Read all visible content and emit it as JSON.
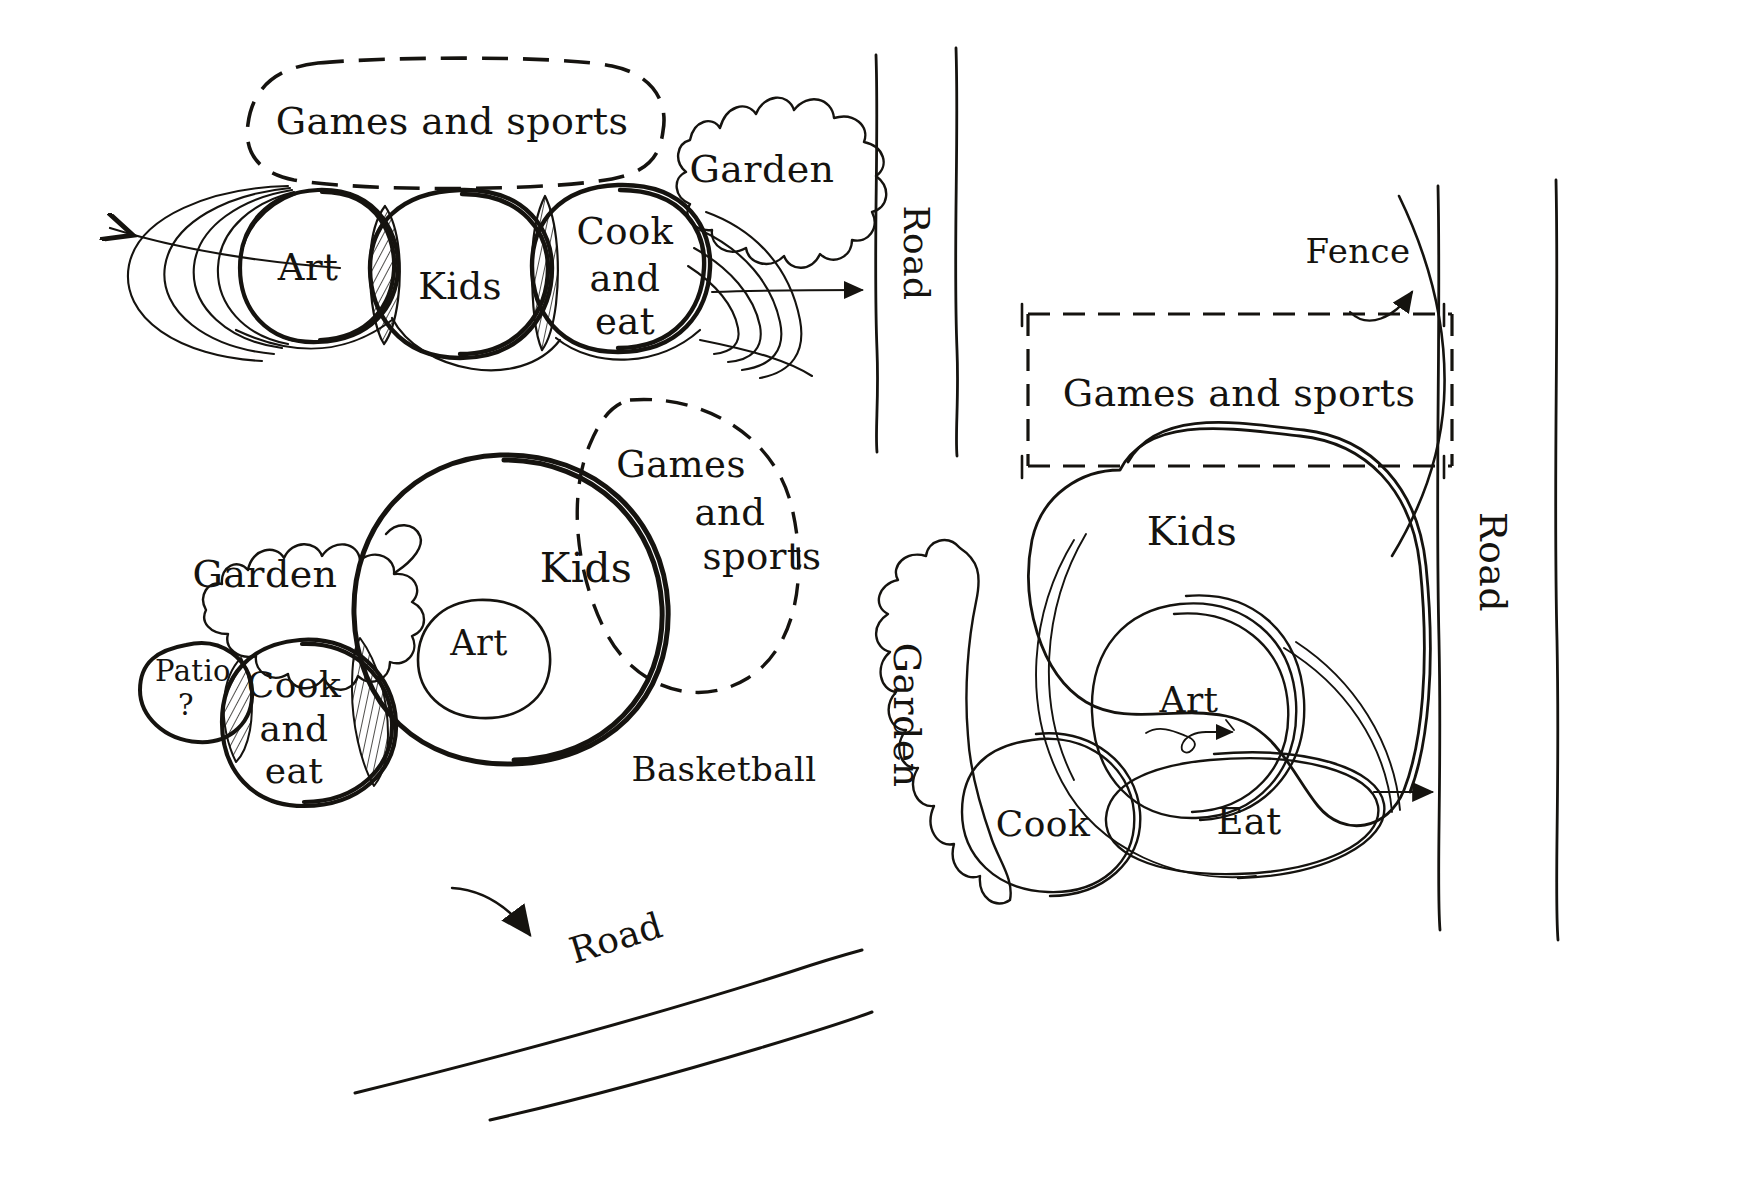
{
  "document": {
    "kind": "hand-drawn architectural bubble diagram",
    "media": "ink sketch on white paper",
    "ink_color": "#15130f",
    "paper_color": "#ffffff"
  },
  "schemes": [
    {
      "id": "scheme-a",
      "position": "top-left",
      "zones": [
        {
          "id": "a-games",
          "label": "Games and sports",
          "shape": "dashed-rounded-blob"
        },
        {
          "id": "a-art",
          "label": "Art",
          "shape": "solid-circle"
        },
        {
          "id": "a-kids",
          "label": "Kids",
          "shape": "solid-circle"
        },
        {
          "id": "a-cook",
          "label": "Cook\nand\neat",
          "shape": "solid-circle"
        },
        {
          "id": "a-garden",
          "label": "Garden",
          "shape": "cloud-blob"
        }
      ],
      "overlaps": [
        {
          "between": [
            "Art",
            "Kids"
          ],
          "style": "hatched-lens"
        },
        {
          "between": [
            "Kids",
            "Cook and eat"
          ],
          "style": "hatched-lens"
        }
      ],
      "arrows": [
        {
          "id": "a-arrow-left",
          "direction": "left",
          "from": "Art",
          "note": "expansion / view"
        },
        {
          "id": "a-arrow-right",
          "direction": "right",
          "from": "Cook and eat",
          "note": "expansion / view"
        }
      ],
      "edges": [
        {
          "id": "a-road",
          "label": "Road",
          "orientation": "vertical",
          "style": "double-line"
        }
      ]
    },
    {
      "id": "scheme-b",
      "position": "middle-left",
      "zones": [
        {
          "id": "b-garden",
          "label": "Garden",
          "shape": "cloud-blob"
        },
        {
          "id": "b-patio",
          "label": "Patio\n?",
          "shape": "solid-blob"
        },
        {
          "id": "b-cook",
          "label": "Cook\nand\neat",
          "shape": "solid-circle"
        },
        {
          "id": "b-kids",
          "label": "Kids",
          "shape": "solid-circle"
        },
        {
          "id": "b-art",
          "label": "Art",
          "shape": "solid-circle-nested-in-kids"
        },
        {
          "id": "b-games",
          "label": "Games\nand\nsports",
          "shape": "dashed-blob"
        }
      ],
      "overlaps": [
        {
          "between": [
            "Patio ?",
            "Cook and eat"
          ],
          "style": "hatched-lens"
        },
        {
          "between": [
            "Cook and eat",
            "Kids"
          ],
          "style": "hatched-lens"
        }
      ],
      "annotations": [
        {
          "id": "b-basketball",
          "label": "Basketball"
        }
      ],
      "arrows": [
        {
          "id": "b-arrow-down",
          "direction": "down-right",
          "note": "toward road"
        }
      ],
      "edges": [
        {
          "id": "b-road",
          "label": "Road",
          "orientation": "diagonal",
          "style": "double-line"
        }
      ]
    },
    {
      "id": "scheme-c",
      "position": "right",
      "zones": [
        {
          "id": "c-games",
          "label": "Games and sports",
          "shape": "dashed-rectangle"
        },
        {
          "id": "c-kids",
          "label": "Kids",
          "shape": "large-horseshoe-blob"
        },
        {
          "id": "c-art",
          "label": "Art",
          "shape": "solid-circle"
        },
        {
          "id": "c-cook",
          "label": "Cook",
          "shape": "solid-circle"
        },
        {
          "id": "c-eat",
          "label": "Eat",
          "shape": "solid-oval"
        },
        {
          "id": "c-garden",
          "label": "Garden",
          "shape": "cloud-blob",
          "orientation": "vertical"
        }
      ],
      "annotations": [
        {
          "id": "c-fence",
          "label": "Fence",
          "leader": "curved-arrow-to-fence-line"
        }
      ],
      "arrows": [
        {
          "id": "c-arrow-right",
          "direction": "right",
          "from": "Eat",
          "note": "toward road"
        },
        {
          "id": "c-arrow-art",
          "direction": "right",
          "from": "Art",
          "note": "small squiggle arrow under Art"
        }
      ],
      "edges": [
        {
          "id": "c-road",
          "label": "Road",
          "orientation": "vertical",
          "style": "double-line"
        },
        {
          "id": "c-fence-line",
          "label": "",
          "orientation": "vertical",
          "style": "single-line"
        }
      ]
    }
  ],
  "labels": {
    "games_and_sports": "Games and sports",
    "games": "Games",
    "and": "and",
    "sports": "sports",
    "garden": "Garden",
    "art": "Art",
    "kids": "Kids",
    "cook": "Cook",
    "cook_line1": "Cook",
    "cook_line2": "and",
    "cook_line3": "eat",
    "eat": "Eat",
    "patio": "Patio",
    "patio_q": "?",
    "road": "Road",
    "fence": "Fence",
    "basketball": "Basketball"
  }
}
